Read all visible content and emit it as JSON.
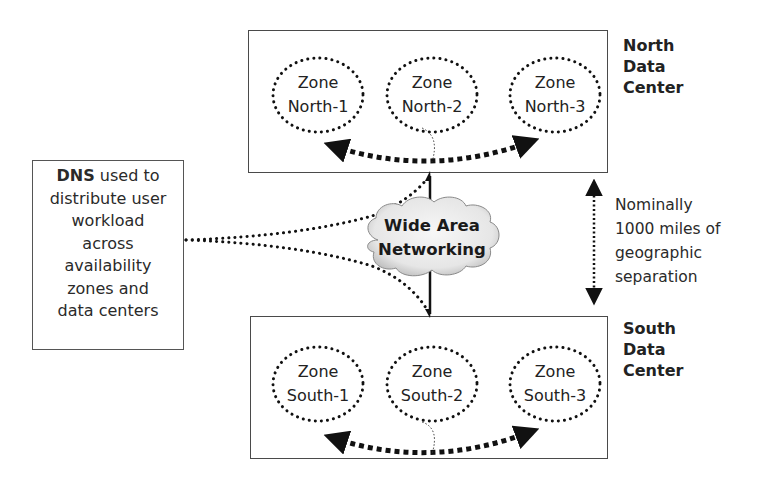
{
  "diagram": {
    "north_dc": {
      "label_line1": "North",
      "label_line2": "Data",
      "label_line3": "Center",
      "zones": [
        {
          "line1": "Zone",
          "line2": "North-1"
        },
        {
          "line1": "Zone",
          "line2": "North-2"
        },
        {
          "line1": "Zone",
          "line2": "North-3"
        }
      ]
    },
    "south_dc": {
      "label_line1": "South",
      "label_line2": "Data",
      "label_line3": "Center",
      "zones": [
        {
          "line1": "Zone",
          "line2": "South-1"
        },
        {
          "line1": "Zone",
          "line2": "South-2"
        },
        {
          "line1": "Zone",
          "line2": "South-3"
        }
      ]
    },
    "dns": {
      "bold": "DNS",
      "line1_rest": " used to",
      "line2": "distribute user",
      "line3": "workload",
      "line4": "across",
      "line5": "availability",
      "line6": "zones and",
      "line7": "data centers"
    },
    "wan": {
      "line1": "Wide Area",
      "line2": "Networking"
    },
    "separation": {
      "line1": "Nominally",
      "line2": "1000 miles of",
      "line3": "geographic",
      "line4": "separation"
    },
    "colors": {
      "stroke": "#1a1a1a",
      "box_border": "#4a4a4a",
      "cloud_fill": "#ececec"
    }
  }
}
